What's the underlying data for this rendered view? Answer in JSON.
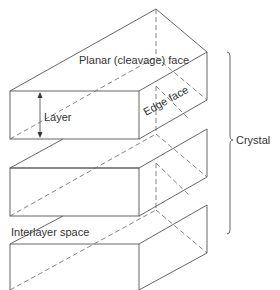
{
  "diagram": {
    "labels": {
      "planar_face": "Planar (cleavage) face",
      "edge_face": "Edge face",
      "layer": "Layer",
      "interlayer_space": "Interlayer space",
      "crystal": "Crystal"
    },
    "layers_count": 3,
    "colors": {
      "line": "#555555",
      "text": "#333333",
      "background": "#ffffff"
    }
  }
}
